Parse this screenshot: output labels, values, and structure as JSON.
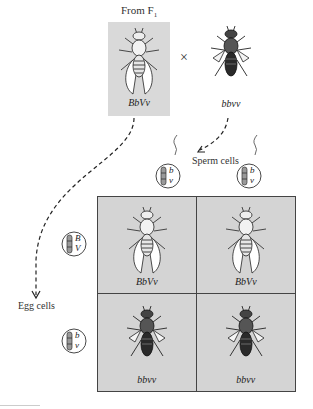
{
  "title_label": "From F",
  "title_subscript": "1",
  "cross_symbol": "×",
  "parents": [
    {
      "genotype": "BbVv",
      "phenotype": "wild-type (gray body, normal wings)"
    },
    {
      "genotype": "bbvv",
      "phenotype": "black body, vestigial wings"
    }
  ],
  "sperm_label": "Sperm cells",
  "egg_label": "Egg cells",
  "sperm_gametes": [
    {
      "allele_top": "b",
      "allele_bottom": "v"
    },
    {
      "allele_top": "b",
      "allele_bottom": "v"
    }
  ],
  "egg_gametes": [
    {
      "allele_top": "B",
      "allele_bottom": "V"
    },
    {
      "allele_top": "b",
      "allele_bottom": "v"
    }
  ],
  "punnett": {
    "rows": [
      [
        {
          "genotype": "BbVv"
        },
        {
          "genotype": "BbVv"
        }
      ],
      [
        {
          "genotype": "bbvv"
        },
        {
          "genotype": "bbvv"
        }
      ]
    ]
  },
  "colors": {
    "box_shade": "#d9d9d9",
    "grid_shade": "#d4d4d4",
    "grid_border": "#444444"
  }
}
